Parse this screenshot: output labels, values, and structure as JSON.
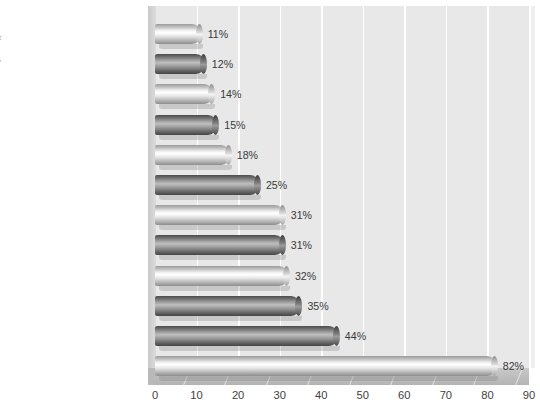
{
  "margin_note": {
    "heading": "s",
    "lines": [
      "ank",
      "d",
      "iew"
    ]
  },
  "chart_data": {
    "type": "bar",
    "orientation": "horizontal",
    "title": "",
    "subtitle": "",
    "xlabel": "",
    "ylabel": "",
    "xlim": [
      0,
      90
    ],
    "xticks": [
      0,
      10,
      20,
      30,
      40,
      50,
      60,
      70,
      80,
      90
    ],
    "grid": true,
    "grid_axis": "x",
    "legend": "none",
    "value_suffix": "%",
    "categories": [
      "Lack of programs/facilities",
      "Personal safety",
      "Lack of staff support",
      "Medical services",
      "Cell conditions",
      "Boredom",
      "Challenges after release",
      "Regrets about the past",
      "Conflict with other prisoners",
      "Missed activities",
      "Loss of freedom",
      "Separation from family and friends"
    ],
    "values": [
      11,
      12,
      14,
      15,
      18,
      25,
      31,
      31,
      32,
      35,
      44,
      82
    ],
    "data_labels": [
      "11%",
      "12%",
      "14%",
      "15%",
      "18%",
      "25%",
      "31%",
      "31%",
      "32%",
      "35%",
      "44%",
      "82%"
    ],
    "bar_styles": [
      "light",
      "dark",
      "light",
      "dark",
      "light",
      "dark",
      "light",
      "dark",
      "light",
      "dark",
      "dark",
      "light"
    ],
    "colors": {
      "panel_background": "#e8e8e8",
      "gridline": "#ffffff",
      "bar_light": "#d8d8d8",
      "bar_dark": "#6e6e6e",
      "floor": "#bdbdbd",
      "label_text": "#404040",
      "axis_text": "#3f3f3f"
    }
  }
}
